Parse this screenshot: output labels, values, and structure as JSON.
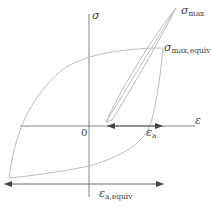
{
  "diagram": {
    "type": "stress-strain hysteresis loops",
    "axes": {
      "y_label": "σ",
      "x_label": "ε",
      "origin_label": "0"
    },
    "labels": {
      "sigma_max": {
        "symbol": "σ",
        "subscript": "max"
      },
      "sigma_max_equiv": {
        "symbol": "σ",
        "subscript": "max,equiv"
      },
      "epsilon_a": {
        "symbol": "ε",
        "subscript": "a"
      },
      "epsilon_a_equiv": {
        "symbol": "ε",
        "subscript": "a,equiv"
      }
    },
    "colors": {
      "axis": "#555555",
      "curve": "#b8b8b8",
      "arrow": "#444444",
      "text": "#444444"
    }
  }
}
